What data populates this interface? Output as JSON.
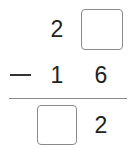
{
  "problem": {
    "operation": "subtraction",
    "operator_symbol": "−",
    "minuend": {
      "tens": "2",
      "ones": ""
    },
    "subtrahend": {
      "tens": "1",
      "ones": "6"
    },
    "difference": {
      "tens": "",
      "ones": "2"
    }
  },
  "inputs": {
    "minuend_ones_placeholder": "",
    "difference_tens_placeholder": ""
  }
}
